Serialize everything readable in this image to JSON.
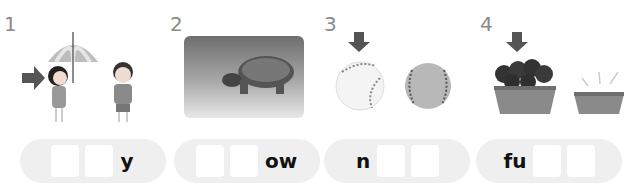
{
  "exercise": {
    "items": [
      {
        "number": "1",
        "image": "girl-under-umbrella-boy",
        "pointer": "arrow-right-to-girl",
        "pattern": [
          "box",
          "box",
          "y"
        ],
        "suffix": "y",
        "prefix": ""
      },
      {
        "number": "2",
        "image": "tortoise-photo",
        "pointer": "",
        "pattern": [
          "box",
          "box",
          "ow"
        ],
        "suffix": "ow",
        "prefix": ""
      },
      {
        "number": "3",
        "image": "new-baseball-and-old-baseball",
        "pointer": "arrow-down-to-new-ball",
        "pattern": [
          "n",
          "box",
          "box"
        ],
        "suffix": "",
        "prefix": "n"
      },
      {
        "number": "4",
        "image": "full-basket-and-empty-basket",
        "pointer": "arrow-down-to-full-basket",
        "pattern": [
          "fu",
          "box",
          "box"
        ],
        "suffix": "",
        "prefix": "fu"
      }
    ]
  },
  "colors": {
    "pill_bg": "#efefef",
    "box_bg": "#ffffff",
    "number_text": "#8a8a8a",
    "arrow": "#555555"
  }
}
